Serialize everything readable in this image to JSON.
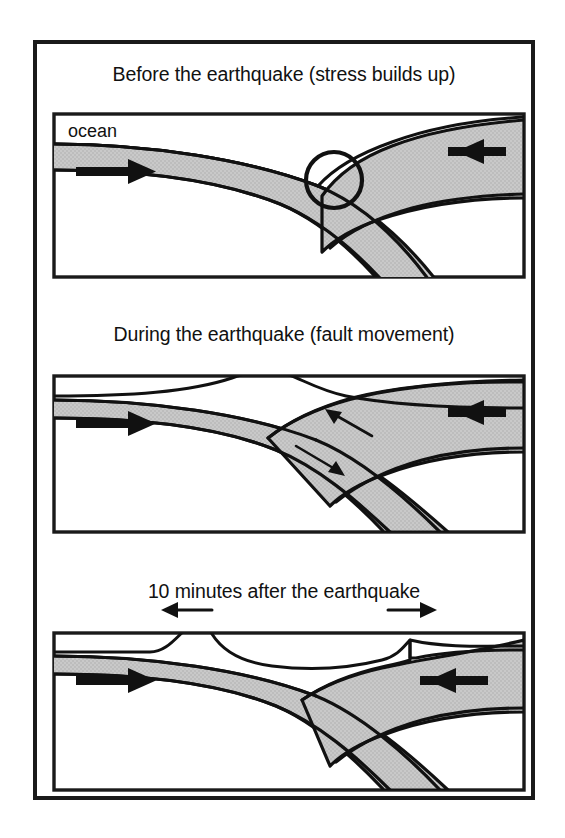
{
  "figure": {
    "kind": "three-panel-cross-section-diagram",
    "background_color": "#ffffff",
    "ink_color": "#111111",
    "plate_fill_color": "#c8c8c8",
    "water_fill_color": "#ffffff"
  },
  "panels": [
    {
      "id": "panel-before",
      "title": "Before the earthquake (stress builds up)",
      "labels": {
        "ocean": "ocean"
      },
      "arrows": [
        {
          "name": "subducting-plate-arrow",
          "direction": "right",
          "weight": "thick"
        },
        {
          "name": "overriding-plate-arrow",
          "direction": "left",
          "weight": "thick"
        }
      ],
      "markers": [
        {
          "name": "locked-zone-circle",
          "shape": "circle"
        }
      ]
    },
    {
      "id": "panel-during",
      "title": "During the earthquake (fault movement)",
      "labels": {},
      "arrows": [
        {
          "name": "subducting-plate-arrow",
          "direction": "right",
          "weight": "thick"
        },
        {
          "name": "overriding-plate-arrow",
          "direction": "left",
          "weight": "thick"
        },
        {
          "name": "upper-plate-rebound-arrow",
          "direction": "up-left",
          "weight": "thin"
        },
        {
          "name": "lower-plate-slip-arrow",
          "direction": "down-right",
          "weight": "thin"
        }
      ],
      "markers": [
        {
          "name": "seafloor-uplift-bulge",
          "shape": "bulge"
        }
      ]
    },
    {
      "id": "panel-after",
      "title": "10 minutes after the earthquake",
      "labels": {},
      "arrows": [
        {
          "name": "subducting-plate-arrow",
          "direction": "right",
          "weight": "thick"
        },
        {
          "name": "overriding-plate-arrow",
          "direction": "left",
          "weight": "thick"
        },
        {
          "name": "tsunami-spread-arrow-left",
          "direction": "left",
          "weight": "medium"
        },
        {
          "name": "tsunami-spread-arrow-right",
          "direction": "right",
          "weight": "medium"
        }
      ],
      "markers": [
        {
          "name": "tsunami-crest-left",
          "shape": "wave-crest"
        },
        {
          "name": "tsunami-crest-right",
          "shape": "wave-crest"
        }
      ]
    }
  ]
}
